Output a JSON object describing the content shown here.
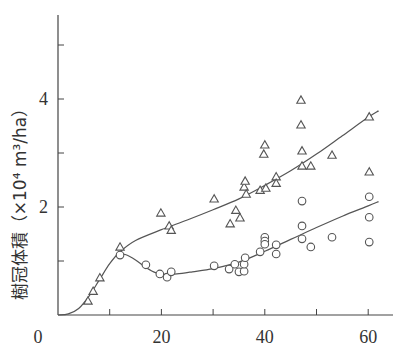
{
  "chart_data": {
    "type": "scatter",
    "title": "",
    "xlabel": "",
    "ylabel": "樹冠体積（×10⁴ m³/ha）",
    "xlim": [
      0,
      65
    ],
    "ylim": [
      0,
      5.4
    ],
    "x_ticks": [
      0,
      10,
      20,
      30,
      40,
      50,
      60
    ],
    "x_tick_labels": [
      "0",
      "",
      "20",
      "",
      "40",
      "",
      "60"
    ],
    "y_ticks": [
      1,
      2,
      3,
      4,
      5
    ],
    "y_tick_labels": [
      "",
      "2",
      "",
      "4",
      ""
    ],
    "grid": false,
    "legend": null,
    "series": [
      {
        "name": "triangle",
        "marker": "triangle-open",
        "points": [
          [
            5.8,
            0.26
          ],
          [
            6.8,
            0.44
          ],
          [
            8.1,
            0.69
          ],
          [
            12.0,
            1.26
          ],
          [
            19.9,
            1.89
          ],
          [
            21.5,
            1.65
          ],
          [
            21.9,
            1.57
          ],
          [
            30.2,
            2.15
          ],
          [
            33.3,
            1.69
          ],
          [
            34.4,
            1.94
          ],
          [
            35.2,
            1.8
          ],
          [
            36.0,
            2.37
          ],
          [
            36.2,
            2.48
          ],
          [
            36.4,
            2.24
          ],
          [
            39.1,
            2.31
          ],
          [
            39.8,
            2.98
          ],
          [
            40.0,
            3.15
          ],
          [
            40.2,
            2.35
          ],
          [
            42.2,
            2.56
          ],
          [
            42.2,
            2.44
          ],
          [
            47.0,
            3.98
          ],
          [
            47.0,
            3.52
          ],
          [
            47.2,
            3.04
          ],
          [
            47.2,
            2.76
          ],
          [
            48.9,
            2.76
          ],
          [
            53.0,
            2.96
          ],
          [
            60.2,
            3.67
          ],
          [
            60.2,
            2.65
          ]
        ],
        "fit_curve": [
          [
            0,
            0
          ],
          [
            2,
            0.02
          ],
          [
            4,
            0.12
          ],
          [
            6,
            0.35
          ],
          [
            8,
            0.65
          ],
          [
            10,
            0.95
          ],
          [
            12,
            1.17
          ],
          [
            15,
            1.38
          ],
          [
            20,
            1.58
          ],
          [
            25,
            1.76
          ],
          [
            30,
            1.95
          ],
          [
            35,
            2.15
          ],
          [
            40,
            2.4
          ],
          [
            45,
            2.67
          ],
          [
            50,
            2.98
          ],
          [
            55,
            3.32
          ],
          [
            60,
            3.66
          ],
          [
            62,
            3.78
          ]
        ]
      },
      {
        "name": "circle",
        "marker": "circle-open",
        "points": [
          [
            12.0,
            1.11
          ],
          [
            17.0,
            0.93
          ],
          [
            19.7,
            0.76
          ],
          [
            21.1,
            0.7
          ],
          [
            21.9,
            0.8
          ],
          [
            30.2,
            0.91
          ],
          [
            33.1,
            0.85
          ],
          [
            34.2,
            0.94
          ],
          [
            35.0,
            0.8
          ],
          [
            36.0,
            0.81
          ],
          [
            36.0,
            0.94
          ],
          [
            36.2,
            1.06
          ],
          [
            39.1,
            1.17
          ],
          [
            40.0,
            1.44
          ],
          [
            40.0,
            1.37
          ],
          [
            40.0,
            1.31
          ],
          [
            42.2,
            1.3
          ],
          [
            42.2,
            1.13
          ],
          [
            47.2,
            2.11
          ],
          [
            47.2,
            1.65
          ],
          [
            47.2,
            1.41
          ],
          [
            48.9,
            1.26
          ],
          [
            53.0,
            1.44
          ],
          [
            60.2,
            2.19
          ],
          [
            60.2,
            1.81
          ],
          [
            60.2,
            1.35
          ]
        ],
        "fit_curve": [
          [
            12,
            1.12
          ],
          [
            13,
            1.12
          ],
          [
            15,
            1.02
          ],
          [
            17,
            0.88
          ],
          [
            19,
            0.78
          ],
          [
            21,
            0.75
          ],
          [
            23,
            0.76
          ],
          [
            26,
            0.8
          ],
          [
            30,
            0.86
          ],
          [
            35,
            0.98
          ],
          [
            40,
            1.18
          ],
          [
            45,
            1.4
          ],
          [
            50,
            1.62
          ],
          [
            55,
            1.83
          ],
          [
            60,
            2.02
          ],
          [
            62,
            2.1
          ]
        ]
      }
    ]
  }
}
